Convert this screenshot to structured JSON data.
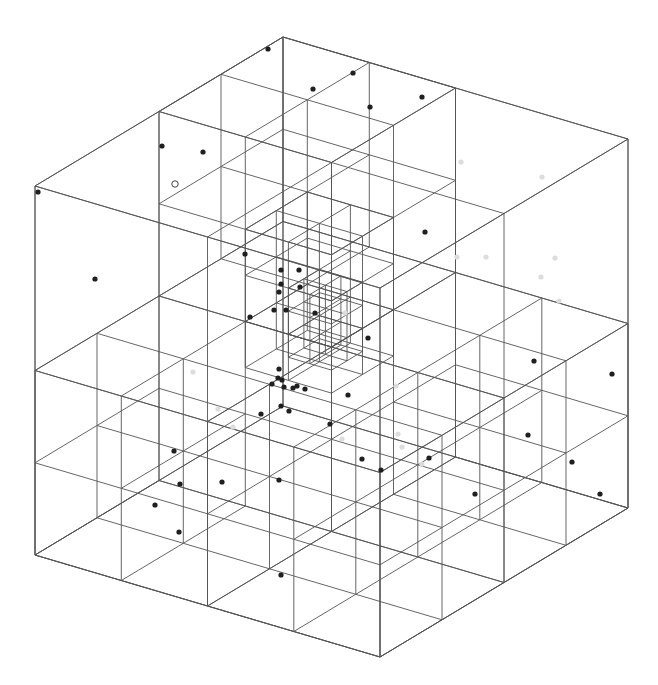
{
  "diagram": {
    "type": "octree-wireframe",
    "colors": {
      "background": "#ffffff",
      "edge": "#555555",
      "point_dark": "#1f1f1f",
      "point_faint": "#dcdcdc"
    },
    "projection": {
      "origin": [
        283,
        37
      ],
      "ex": [
        345,
        102
      ],
      "ey": [
        -248,
        149
      ],
      "ez": [
        0,
        369
      ]
    },
    "cells": [
      {
        "o": [
          0,
          0,
          0
        ],
        "s": 1
      },
      {
        "o": [
          0,
          0,
          0
        ],
        "s": 0.5
      },
      {
        "o": [
          0.5,
          0,
          0
        ],
        "s": 0.5
      },
      {
        "o": [
          0,
          0.5,
          0
        ],
        "s": 0.5
      },
      {
        "o": [
          0.5,
          0.5,
          0
        ],
        "s": 0.5
      },
      {
        "o": [
          0,
          0,
          0.5
        ],
        "s": 0.5
      },
      {
        "o": [
          0.5,
          0,
          0.5
        ],
        "s": 0.5
      },
      {
        "o": [
          0,
          0.5,
          0.5
        ],
        "s": 0.5
      },
      {
        "o": [
          0.5,
          0.5,
          0.5
        ],
        "s": 0.5
      },
      {
        "o": [
          0,
          0,
          0
        ],
        "s": 0.25
      },
      {
        "o": [
          0.25,
          0,
          0
        ],
        "s": 0.25
      },
      {
        "o": [
          0,
          0.25,
          0
        ],
        "s": 0.25
      },
      {
        "o": [
          0.25,
          0.25,
          0
        ],
        "s": 0.25
      },
      {
        "o": [
          0,
          0,
          0.25
        ],
        "s": 0.25
      },
      {
        "o": [
          0.25,
          0,
          0.25
        ],
        "s": 0.25
      },
      {
        "o": [
          0,
          0.25,
          0.25
        ],
        "s": 0.25
      },
      {
        "o": [
          0.25,
          0.25,
          0.25
        ],
        "s": 0.25
      },
      {
        "o": [
          0.5,
          0.5,
          0.5
        ],
        "s": 0.25
      },
      {
        "o": [
          0.75,
          0.5,
          0.5
        ],
        "s": 0.25
      },
      {
        "o": [
          0.5,
          0.75,
          0.5
        ],
        "s": 0.25
      },
      {
        "o": [
          0.75,
          0.75,
          0.5
        ],
        "s": 0.25
      },
      {
        "o": [
          0.5,
          0.5,
          0.75
        ],
        "s": 0.25
      },
      {
        "o": [
          0.75,
          0.5,
          0.75
        ],
        "s": 0.25
      },
      {
        "o": [
          0.5,
          0.75,
          0.75
        ],
        "s": 0.25
      },
      {
        "o": [
          0.75,
          0.75,
          0.75
        ],
        "s": 0.25
      },
      {
        "o": [
          0.5,
          0,
          0.5
        ],
        "s": 0.25
      },
      {
        "o": [
          0.75,
          0,
          0.5
        ],
        "s": 0.25
      },
      {
        "o": [
          0.5,
          0.25,
          0.5
        ],
        "s": 0.25
      },
      {
        "o": [
          0.75,
          0.25,
          0.5
        ],
        "s": 0.25
      },
      {
        "o": [
          0.5,
          0,
          0.75
        ],
        "s": 0.25
      },
      {
        "o": [
          0.75,
          0,
          0.75
        ],
        "s": 0.25
      },
      {
        "o": [
          0.5,
          0.25,
          0.75
        ],
        "s": 0.25
      },
      {
        "o": [
          0.75,
          0.25,
          0.75
        ],
        "s": 0.25
      },
      {
        "o": [
          0,
          0.5,
          0.5
        ],
        "s": 0.25
      },
      {
        "o": [
          0.25,
          0.5,
          0.5
        ],
        "s": 0.25
      },
      {
        "o": [
          0,
          0.75,
          0.5
        ],
        "s": 0.25
      },
      {
        "o": [
          0.25,
          0.75,
          0.5
        ],
        "s": 0.25
      },
      {
        "o": [
          0,
          0.5,
          0.75
        ],
        "s": 0.25
      },
      {
        "o": [
          0.25,
          0.5,
          0.75
        ],
        "s": 0.25
      },
      {
        "o": [
          0,
          0.75,
          0.75
        ],
        "s": 0.25
      },
      {
        "o": [
          0.25,
          0.75,
          0.75
        ],
        "s": 0.25
      },
      {
        "o": [
          0.25,
          0.25,
          0.25
        ],
        "s": 0.125
      },
      {
        "o": [
          0.375,
          0.25,
          0.25
        ],
        "s": 0.125
      },
      {
        "o": [
          0.25,
          0.375,
          0.25
        ],
        "s": 0.125
      },
      {
        "o": [
          0.375,
          0.375,
          0.25
        ],
        "s": 0.125
      },
      {
        "o": [
          0.25,
          0.25,
          0.375
        ],
        "s": 0.125
      },
      {
        "o": [
          0.375,
          0.25,
          0.375
        ],
        "s": 0.125
      },
      {
        "o": [
          0.25,
          0.375,
          0.375
        ],
        "s": 0.125
      },
      {
        "o": [
          0.375,
          0.375,
          0.375
        ],
        "s": 0.125
      },
      {
        "o": [
          0.375,
          0.375,
          0.375
        ],
        "s": 0.0625
      },
      {
        "o": [
          0.4375,
          0.375,
          0.375
        ],
        "s": 0.0625
      },
      {
        "o": [
          0.375,
          0.4375,
          0.375
        ],
        "s": 0.0625
      },
      {
        "o": [
          0.4375,
          0.4375,
          0.375
        ],
        "s": 0.0625
      },
      {
        "o": [
          0.375,
          0.375,
          0.4375
        ],
        "s": 0.0625
      },
      {
        "o": [
          0.4375,
          0.375,
          0.4375
        ],
        "s": 0.0625
      },
      {
        "o": [
          0.375,
          0.4375,
          0.4375
        ],
        "s": 0.0625
      },
      {
        "o": [
          0.4375,
          0.4375,
          0.4375
        ],
        "s": 0.0625
      },
      {
        "o": [
          0.25,
          0.25,
          0.5
        ],
        "s": 0.125
      },
      {
        "o": [
          0.375,
          0.25,
          0.5
        ],
        "s": 0.125
      },
      {
        "o": [
          0.25,
          0.375,
          0.5
        ],
        "s": 0.125
      },
      {
        "o": [
          0.375,
          0.375,
          0.5
        ],
        "s": 0.125
      },
      {
        "o": [
          0.375,
          0.375,
          0.5
        ],
        "s": 0.0625
      },
      {
        "o": [
          0.4375,
          0.375,
          0.5
        ],
        "s": 0.0625
      },
      {
        "o": [
          0.375,
          0.4375,
          0.5
        ],
        "s": 0.0625
      },
      {
        "o": [
          0.4375,
          0.4375,
          0.5
        ],
        "s": 0.0625
      }
    ],
    "points": [
      {
        "x": 268,
        "y": 49,
        "k": "dark"
      },
      {
        "x": 313,
        "y": 89,
        "k": "dark"
      },
      {
        "x": 353,
        "y": 73,
        "k": "dark"
      },
      {
        "x": 370,
        "y": 107,
        "k": "dark"
      },
      {
        "x": 422,
        "y": 97,
        "k": "dark"
      },
      {
        "x": 162,
        "y": 146,
        "k": "dark"
      },
      {
        "x": 203,
        "y": 152,
        "k": "dark"
      },
      {
        "x": 175,
        "y": 184,
        "k": "hollow"
      },
      {
        "x": 38,
        "y": 192,
        "k": "dark"
      },
      {
        "x": 95,
        "y": 279,
        "k": "dark"
      },
      {
        "x": 425,
        "y": 232,
        "k": "dark"
      },
      {
        "x": 245,
        "y": 254,
        "k": "dark"
      },
      {
        "x": 281,
        "y": 270,
        "k": "dark"
      },
      {
        "x": 299,
        "y": 270,
        "k": "dark"
      },
      {
        "x": 281,
        "y": 284,
        "k": "dark"
      },
      {
        "x": 300,
        "y": 287,
        "k": "dark"
      },
      {
        "x": 279,
        "y": 292,
        "k": "dark"
      },
      {
        "x": 274,
        "y": 310,
        "k": "dark"
      },
      {
        "x": 286,
        "y": 310,
        "k": "dark"
      },
      {
        "x": 315,
        "y": 313,
        "k": "dark"
      },
      {
        "x": 250,
        "y": 317,
        "k": "dark"
      },
      {
        "x": 368,
        "y": 338,
        "k": "dark"
      },
      {
        "x": 279,
        "y": 369,
        "k": "dark"
      },
      {
        "x": 272,
        "y": 384,
        "k": "dark"
      },
      {
        "x": 282,
        "y": 380,
        "k": "dark"
      },
      {
        "x": 284,
        "y": 387,
        "k": "dark"
      },
      {
        "x": 293,
        "y": 388,
        "k": "dark"
      },
      {
        "x": 297,
        "y": 386,
        "k": "dark"
      },
      {
        "x": 305,
        "y": 389,
        "k": "dark"
      },
      {
        "x": 278,
        "y": 378,
        "k": "dark"
      },
      {
        "x": 281,
        "y": 406,
        "k": "dark"
      },
      {
        "x": 289,
        "y": 411,
        "k": "dark"
      },
      {
        "x": 261,
        "y": 414,
        "k": "dark"
      },
      {
        "x": 348,
        "y": 395,
        "k": "dark"
      },
      {
        "x": 330,
        "y": 424,
        "k": "dark"
      },
      {
        "x": 174,
        "y": 451,
        "k": "dark"
      },
      {
        "x": 180,
        "y": 484,
        "k": "dark"
      },
      {
        "x": 222,
        "y": 482,
        "k": "dark"
      },
      {
        "x": 279,
        "y": 480,
        "k": "dark"
      },
      {
        "x": 155,
        "y": 505,
        "k": "dark"
      },
      {
        "x": 179,
        "y": 532,
        "k": "dark"
      },
      {
        "x": 281,
        "y": 575,
        "k": "dark"
      },
      {
        "x": 362,
        "y": 459,
        "k": "dark"
      },
      {
        "x": 381,
        "y": 470,
        "k": "dark"
      },
      {
        "x": 429,
        "y": 458,
        "k": "dark"
      },
      {
        "x": 475,
        "y": 494,
        "k": "dark"
      },
      {
        "x": 534,
        "y": 361,
        "k": "dark"
      },
      {
        "x": 612,
        "y": 374,
        "k": "dark"
      },
      {
        "x": 528,
        "y": 435,
        "k": "dark"
      },
      {
        "x": 572,
        "y": 462,
        "k": "dark"
      },
      {
        "x": 600,
        "y": 494,
        "k": "dark"
      },
      {
        "x": 461,
        "y": 162,
        "k": "faint"
      },
      {
        "x": 542,
        "y": 177,
        "k": "faint"
      },
      {
        "x": 486,
        "y": 257,
        "k": "faint"
      },
      {
        "x": 555,
        "y": 258,
        "k": "faint"
      },
      {
        "x": 541,
        "y": 277,
        "k": "faint"
      },
      {
        "x": 559,
        "y": 301,
        "k": "faint"
      },
      {
        "x": 457,
        "y": 257,
        "k": "faint"
      },
      {
        "x": 345,
        "y": 313,
        "k": "faint"
      },
      {
        "x": 193,
        "y": 372,
        "k": "faint"
      },
      {
        "x": 218,
        "y": 409,
        "k": "faint"
      },
      {
        "x": 233,
        "y": 427,
        "k": "faint"
      },
      {
        "x": 396,
        "y": 386,
        "k": "faint"
      },
      {
        "x": 398,
        "y": 434,
        "k": "faint"
      },
      {
        "x": 342,
        "y": 439,
        "k": "faint"
      },
      {
        "x": 402,
        "y": 447,
        "k": "faint"
      },
      {
        "x": 422,
        "y": 464,
        "k": "faint"
      }
    ]
  }
}
